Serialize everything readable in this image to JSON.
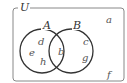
{
  "diagram": {
    "type": "venn",
    "universe_label": "U",
    "sets": [
      {
        "label": "A"
      },
      {
        "label": "B"
      }
    ],
    "elements": {
      "only_A": [
        "d",
        "e",
        "h"
      ],
      "A_and_B": [
        "b"
      ],
      "only_B": [
        "c",
        "g"
      ],
      "outside": [
        "a",
        "f"
      ]
    },
    "items": {
      "a": "a",
      "b": "b",
      "c": "c",
      "d": "d",
      "e": "e",
      "f": "f",
      "g": "g",
      "h": "h"
    },
    "colors": {
      "stroke": "#333333",
      "frame": "#777777",
      "text": "#555555"
    }
  }
}
